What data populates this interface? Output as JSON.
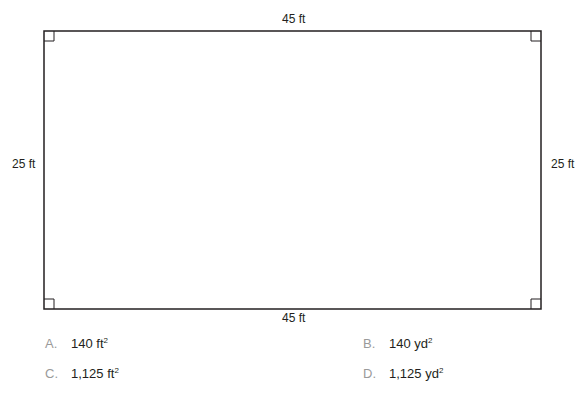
{
  "figure": {
    "shape": "rectangle",
    "right_angle_markers": 4,
    "labels": {
      "top": "45 ft",
      "bottom": "45 ft",
      "left": "25 ft",
      "right": "25 ft"
    },
    "stroke_color": "#231f20"
  },
  "choices": [
    {
      "letter": "A.",
      "value": "140 ft",
      "exponent": "2"
    },
    {
      "letter": "B.",
      "value": "140 yd",
      "exponent": "2"
    },
    {
      "letter": "C.",
      "value": "1,125 ft",
      "exponent": "2"
    },
    {
      "letter": "D.",
      "value": "1,125 yd",
      "exponent": "2"
    }
  ],
  "colors": {
    "text": "#231f20",
    "letter": "#9a9a9a"
  }
}
